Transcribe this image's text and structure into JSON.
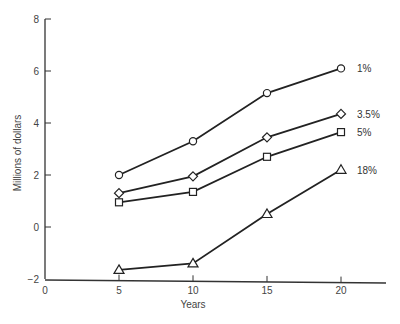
{
  "chart_data": {
    "type": "line",
    "title": "",
    "xlabel": "Years",
    "ylabel": "Millions of dollars",
    "x": [
      5,
      10,
      15,
      20
    ],
    "xlim": [
      0,
      23
    ],
    "ylim": [
      -2,
      8
    ],
    "x_ticks": [
      0,
      5,
      10,
      15,
      20
    ],
    "y_ticks": [
      -2,
      0,
      2,
      4,
      6,
      8
    ],
    "y_tick_labels": [
      "−2",
      "0",
      "2",
      "4",
      "6",
      "8"
    ],
    "grid": false,
    "legend_position": "inline-right",
    "series": [
      {
        "name": "1%",
        "marker": "circle",
        "values": [
          2.0,
          3.3,
          5.15,
          6.1
        ]
      },
      {
        "name": "3.5%",
        "marker": "diamond",
        "values": [
          1.3,
          1.95,
          3.45,
          4.35
        ]
      },
      {
        "name": "5%",
        "marker": "square",
        "values": [
          0.95,
          1.35,
          2.7,
          3.65
        ]
      },
      {
        "name": "18%",
        "marker": "triangle",
        "values": [
          -1.65,
          -1.4,
          0.5,
          2.2
        ]
      }
    ]
  },
  "style": {
    "line_color": "#222222",
    "axis_color": "#333333",
    "text_color": "#444444",
    "background": "#ffffff"
  }
}
